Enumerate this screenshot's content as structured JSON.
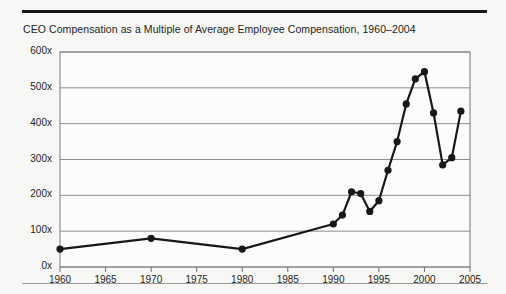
{
  "figure": {
    "title": "CEO Compensation as a Multiple of Average Employee Compensation, 1960–2004",
    "rule_color": "#14171a",
    "footer_rule_color": "#9a9a9a",
    "background": "#f7f7f5"
  },
  "chart_data": {
    "type": "line",
    "title": "CEO Compensation as a Multiple of Average Employee Compensation, 1960–2004",
    "xlabel": "",
    "ylabel": "",
    "xlim": [
      1960,
      2005
    ],
    "ylim": [
      0,
      600
    ],
    "grid": true,
    "legend": false,
    "line_color": "#16181a",
    "marker_color": "#16181a",
    "marker_shape": "circle",
    "gridline_color": "#8c8c8c",
    "frame_color": "#8c8c8c",
    "xticks": [
      1960,
      1965,
      1970,
      1975,
      1980,
      1985,
      1990,
      1995,
      2000,
      2005
    ],
    "xtick_labels": [
      "1960",
      "1965",
      "1970",
      "1975",
      "1980",
      "1985",
      "1990",
      "1995",
      "2000",
      "2005"
    ],
    "yticks": [
      0,
      100,
      200,
      300,
      400,
      500,
      600
    ],
    "ytick_labels": [
      "0x",
      "100x",
      "200x",
      "300x",
      "400x",
      "500x",
      "600x"
    ],
    "x": [
      1960,
      1970,
      1980,
      1990,
      1991,
      1992,
      1993,
      1994,
      1995,
      1996,
      1997,
      1998,
      1999,
      2000,
      2001,
      2002,
      2003,
      2004
    ],
    "values": [
      50,
      80,
      50,
      120,
      145,
      210,
      205,
      155,
      185,
      270,
      350,
      455,
      525,
      545,
      430,
      285,
      305,
      435
    ],
    "series": [
      {
        "name": "CEO compensation multiple",
        "x": [
          1960,
          1970,
          1980,
          1990,
          1991,
          1992,
          1993,
          1994,
          1995,
          1996,
          1997,
          1998,
          1999,
          2000,
          2001,
          2002,
          2003,
          2004
        ],
        "values": [
          50,
          80,
          50,
          120,
          145,
          210,
          205,
          155,
          185,
          270,
          350,
          455,
          525,
          545,
          430,
          285,
          305,
          435
        ]
      }
    ]
  }
}
